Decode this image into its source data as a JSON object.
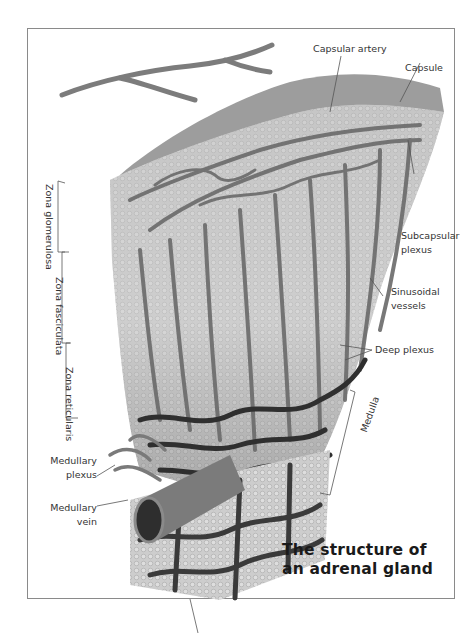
{
  "title": {
    "line1": "The structure of",
    "line2": "an adrenal gland"
  },
  "labels": {
    "capsular_artery": "Capsular artery",
    "capsule": "Capsule",
    "subcapsular_plexus_1": "Subcapsular",
    "subcapsular_plexus_2": "plexus",
    "sinusoidal_vessels_1": "Sinusoidal",
    "sinusoidal_vessels_2": "vessels",
    "deep_plexus": "Deep plexus",
    "medulla": "Medulla",
    "medullary_plexus_1": "Medullary",
    "medullary_plexus_2": "plexus",
    "medullary_vein_1": "Medullary",
    "medullary_vein_2": "vein",
    "zona_glomerulosa": "Zona glomerulosa",
    "zona_fasciculata": "Zona fasciculata",
    "zona_reticularis": "Zona reticularis"
  },
  "colors": {
    "capsule": "#9a9a9a",
    "cortex": "#c9c9c9",
    "vessel": "#6e6e6e",
    "vessel_dark": "#3a3a3a",
    "frame": "#8a8a8a"
  }
}
